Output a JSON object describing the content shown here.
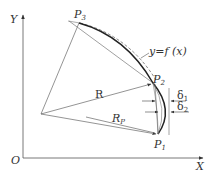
{
  "diagram": {
    "axes": {
      "x_label": "X",
      "y_label": "Y",
      "origin_label": "O"
    },
    "points": {
      "p1": {
        "label": "P",
        "sub": "1"
      },
      "p2": {
        "label": "P",
        "sub": "2"
      },
      "p3": {
        "label": "P",
        "sub": "3"
      }
    },
    "curve_label": "y=f (x)",
    "radius_labels": {
      "r": "R",
      "rp": {
        "label": "R",
        "sub": "P"
      }
    },
    "deviations": {
      "delta1": {
        "label": "δ",
        "sub": "1"
      },
      "delta2": {
        "label": "δ",
        "sub": "2"
      }
    },
    "colors": {
      "line": "#444444",
      "thin_line": "#777777",
      "curve": "#222222",
      "text": "#333333"
    }
  }
}
